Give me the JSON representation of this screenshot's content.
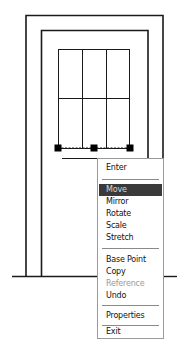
{
  "drawing": {
    "description": "CAD elevation of a door/window frame with a selected sill line showing grips",
    "line_color": "#1a1a1a",
    "grip_color": "#000000",
    "grips": [
      {
        "name": "grip-left",
        "x": 58,
        "y": 148
      },
      {
        "name": "grip-mid",
        "x": 94,
        "y": 148
      },
      {
        "name": "grip-right",
        "x": 130,
        "y": 148
      }
    ]
  },
  "context_menu": {
    "items": [
      {
        "label": "Enter",
        "state": "normal"
      },
      {
        "separator": true
      },
      {
        "label": "Move",
        "state": "highlighted"
      },
      {
        "label": "Mirror",
        "state": "normal"
      },
      {
        "label": "Rotate",
        "state": "normal"
      },
      {
        "label": "Scale",
        "state": "normal"
      },
      {
        "label": "Stretch",
        "state": "normal"
      },
      {
        "separator": true
      },
      {
        "label": "Base Point",
        "state": "normal"
      },
      {
        "label": "Copy",
        "state": "normal"
      },
      {
        "label": "Reference",
        "state": "disabled"
      },
      {
        "label": "Undo",
        "state": "normal"
      },
      {
        "separator": true
      },
      {
        "label": "Properties",
        "state": "normal"
      },
      {
        "separator": true
      },
      {
        "label": "Exit",
        "state": "normal"
      }
    ],
    "labels": {
      "enter": "Enter",
      "move": "Move",
      "mirror": "Mirror",
      "rotate": "Rotate",
      "scale": "Scale",
      "stretch": "Stretch",
      "base_point": "Base Point",
      "copy": "Copy",
      "reference": "Reference",
      "undo": "Undo",
      "properties": "Properties",
      "exit": "Exit"
    },
    "highlight_color": "#3a3a3a"
  }
}
